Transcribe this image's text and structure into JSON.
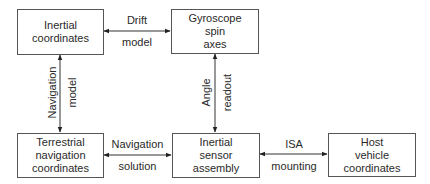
{
  "diagram": {
    "nodes": {
      "inertial_coordinates": {
        "lines": [
          "Inertial",
          "coordinates"
        ]
      },
      "gyroscope_spin_axes": {
        "lines": [
          "Gyroscope",
          "spin",
          "axes"
        ]
      },
      "terrestrial_navigation_coordinates": {
        "lines": [
          "Terrestrial",
          "navigation",
          "coordinates"
        ]
      },
      "inertial_sensor_assembly": {
        "lines": [
          "Inertial",
          "sensor",
          "assembly"
        ]
      },
      "host_vehicle_coordinates": {
        "lines": [
          "Host",
          "vehicle",
          "coordinates"
        ]
      }
    },
    "edges": {
      "drift_model": {
        "top": "Drift",
        "bottom": "model",
        "from": "Inertial coordinates",
        "to": "Gyroscope spin axes",
        "bidirectional": true
      },
      "navigation_model": {
        "left": "Navigation",
        "right": "model",
        "from": "Inertial coordinates",
        "to": "Terrestrial navigation coordinates",
        "bidirectional": true
      },
      "angle_readout": {
        "left": "Angle",
        "right": "readout",
        "from": "Gyroscope spin axes",
        "to": "Inertial sensor assembly",
        "bidirectional": true
      },
      "navigation_solution": {
        "top": "Navigation",
        "bottom": "solution",
        "from": "Terrestrial navigation coordinates",
        "to": "Inertial sensor assembly",
        "bidirectional": true
      },
      "isa_mounting": {
        "top": "ISA",
        "bottom": "mounting",
        "from": "Inertial sensor assembly",
        "to": "Host vehicle coordinates",
        "bidirectional": true
      }
    }
  }
}
